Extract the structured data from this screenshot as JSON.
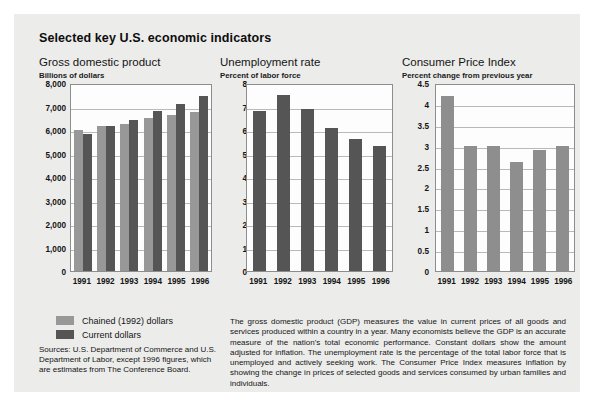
{
  "title": "Selected key U.S. economic indicators",
  "legend": {
    "items": [
      {
        "label": "Chained (1992) dollars",
        "color": "#989898",
        "key": "chained"
      },
      {
        "label": "Current dollars",
        "color": "#555555",
        "key": "current"
      }
    ]
  },
  "sources": "Sources: U.S. Department of Commerce and U.S. Department of Labor, except 1996 figures, which are estimates from The Conference Board.",
  "description": "The gross domestic product (GDP) measures the value in current prices of all goods and services produced within a country in a year. Many economists believe the GDP is an accurate measure of the nation's total economic performance. Constant dollars show the amount adjusted for inflation. The unemployment rate is the percentage of the total labor force that is unemployed and actively seeking work. The Consumer Price Index measures inflation by showing the change in prices of selected goods and services consumed by urban families and individuals.",
  "chart_data": [
    {
      "type": "bar",
      "id": "gdp",
      "title": "Gross domestic product",
      "subtitle": "Billions of dollars",
      "xlabel": "",
      "ylabel": "Billions of dollars",
      "categories": [
        "1991",
        "1992",
        "1993",
        "1994",
        "1995",
        "1996"
      ],
      "series": [
        {
          "name": "Chained (1992) dollars",
          "color": "#989898",
          "values": [
            6000,
            6150,
            6250,
            6500,
            6620,
            6780
          ]
        },
        {
          "name": "Current dollars",
          "color": "#555555",
          "values": [
            5820,
            6150,
            6440,
            6820,
            7120,
            7460
          ]
        }
      ],
      "ylim": [
        0,
        8000
      ],
      "yticks": [
        8000,
        7000,
        6000,
        5000,
        4000,
        3000,
        2000,
        1000,
        0
      ],
      "ytick_labels": [
        "8,000",
        "7,000",
        "6,000",
        "5,000",
        "4,000",
        "3,000",
        "2,000",
        "1,000",
        "0"
      ],
      "grid": true,
      "legend_position": "below-left"
    },
    {
      "type": "bar",
      "id": "unemployment",
      "title": "Unemployment rate",
      "subtitle": "Percent of labor force",
      "xlabel": "",
      "ylabel": "Percent of labor force",
      "categories": [
        "1991",
        "1992",
        "1993",
        "1994",
        "1995",
        "1996"
      ],
      "series": [
        {
          "name": "Unemployment rate",
          "color": "#555555",
          "values": [
            6.8,
            7.5,
            6.9,
            6.1,
            5.6,
            5.3
          ]
        }
      ],
      "ylim": [
        0,
        8
      ],
      "yticks": [
        8,
        7,
        6,
        5,
        4,
        3,
        2,
        1,
        0
      ],
      "ytick_labels": [
        "8",
        "7",
        "6",
        "5",
        "4",
        "3",
        "2",
        "1",
        "0"
      ],
      "grid": true,
      "legend_position": "none"
    },
    {
      "type": "bar",
      "id": "cpi",
      "title": "Consumer Price Index",
      "subtitle": "Percent change from previous year",
      "xlabel": "",
      "ylabel": "Percent change from previous year",
      "categories": [
        "1991",
        "1992",
        "1993",
        "1994",
        "1995",
        "1996"
      ],
      "series": [
        {
          "name": "Percent change from previous year",
          "color": "#8e8e8e",
          "values": [
            4.2,
            3.0,
            3.0,
            2.6,
            2.9,
            3.0
          ]
        }
      ],
      "ylim": [
        0,
        4.5
      ],
      "yticks": [
        4.5,
        4,
        3.5,
        3,
        2.5,
        2,
        1.5,
        1,
        0.5,
        0
      ],
      "ytick_labels": [
        "4.5",
        "4",
        "3.5",
        "3",
        "2.5",
        "2",
        "1.5",
        "1",
        "0.5",
        "0"
      ],
      "grid": true,
      "legend_position": "none"
    }
  ]
}
